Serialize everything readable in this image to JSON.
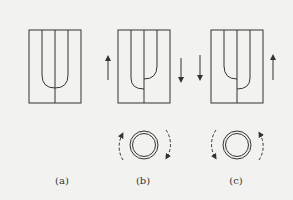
{
  "figure": {
    "panels": [
      {
        "id": "a",
        "label": "(a)",
        "description": "Mixing tube with two streams merging symmetrically (no rotation)"
      },
      {
        "id": "b",
        "label": "(b)",
        "description": "Left wall moving up, right wall moving down; clockwise rotation"
      },
      {
        "id": "c",
        "label": "(c)",
        "description": "Left wall moving down, right wall moving up; counter-clockwise rotation"
      }
    ],
    "colors": {
      "line": "#333333",
      "background": "#f2f2f0"
    }
  }
}
